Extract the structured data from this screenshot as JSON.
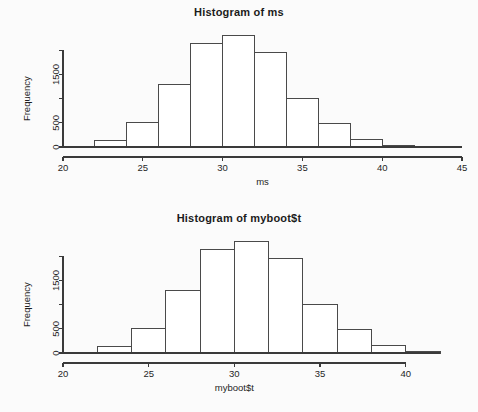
{
  "page": {
    "background_color": "#fbfbfb",
    "foreground_color": "#1f1f1f",
    "axis_color": "#3a3a3a",
    "bar_fill_color": "#ffffff",
    "bar_stroke_color": "#4a4a4a"
  },
  "charts": [
    {
      "id": "histogram-ms",
      "title": "Histogram of ms",
      "xlabel": "ms",
      "ylabel": "Frequency"
    },
    {
      "id": "histogram-myboot-t",
      "title": "Histogram of myboot$t",
      "xlabel": "myboot$t",
      "ylabel": "Frequency"
    }
  ],
  "chart_data": [
    {
      "type": "bar",
      "subtype": "histogram",
      "title": "Histogram of ms",
      "xlabel": "ms",
      "ylabel": "Frequency",
      "bin_width": 2,
      "bin_edges": [
        22,
        24,
        26,
        28,
        30,
        32,
        34,
        36,
        38,
        40,
        42
      ],
      "categories": [
        "22-24",
        "24-26",
        "26-28",
        "28-30",
        "30-32",
        "32-34",
        "34-36",
        "36-38",
        "38-40",
        "40-42"
      ],
      "values": [
        130,
        500,
        1300,
        2150,
        2300,
        1950,
        1000,
        490,
        160,
        40
      ],
      "xlim": [
        20,
        45
      ],
      "ylim": [
        0,
        2400
      ],
      "xticks": [
        20,
        25,
        30,
        35,
        40,
        45
      ],
      "xtick_labels": [
        "20",
        "25",
        "30",
        "35",
        "40",
        "45"
      ],
      "yticks": [
        0,
        500,
        1000,
        1500,
        2000
      ],
      "ytick_labels": [
        "0",
        "500",
        "",
        "1500",
        ""
      ],
      "grid": false,
      "legend": "none"
    },
    {
      "type": "bar",
      "subtype": "histogram",
      "title": "Histogram of myboot$t",
      "xlabel": "myboot$t",
      "ylabel": "Frequency",
      "bin_width": 2,
      "bin_edges": [
        22,
        24,
        26,
        28,
        30,
        32,
        34,
        36,
        38,
        40,
        42
      ],
      "categories": [
        "22-24",
        "24-26",
        "26-28",
        "28-30",
        "30-32",
        "32-34",
        "34-36",
        "36-38",
        "38-40",
        "40-42"
      ],
      "values": [
        130,
        500,
        1300,
        2150,
        2300,
        1950,
        1000,
        490,
        160,
        40
      ],
      "xlim": [
        20,
        42
      ],
      "ylim": [
        0,
        2400
      ],
      "xticks": [
        20,
        25,
        30,
        35,
        40
      ],
      "xtick_labels": [
        "20",
        "25",
        "30",
        "35",
        "40"
      ],
      "yticks": [
        0,
        500,
        1000,
        1500,
        2000
      ],
      "ytick_labels": [
        "0",
        "500",
        "",
        "1500",
        ""
      ],
      "grid": false,
      "legend": "none"
    }
  ]
}
